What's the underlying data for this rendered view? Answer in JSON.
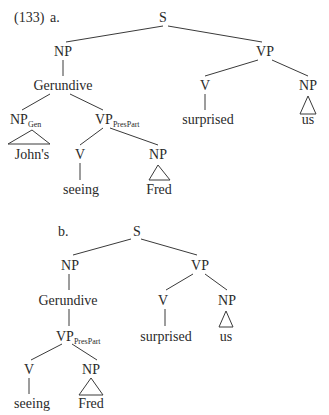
{
  "example_number": "(133)",
  "trees": [
    {
      "label": "a.",
      "label_pos": [
        50,
        22
      ],
      "nodes": [
        {
          "id": "S",
          "text": "S",
          "x": 163,
          "y": 22
        },
        {
          "id": "NP",
          "text": "NP",
          "x": 63,
          "y": 56
        },
        {
          "id": "VP",
          "text": "VP",
          "x": 265,
          "y": 56
        },
        {
          "id": "Ger",
          "text": "Gerundive",
          "x": 63,
          "y": 90
        },
        {
          "id": "V1",
          "text": "V",
          "x": 205,
          "y": 90
        },
        {
          "id": "NP2",
          "text": "NP",
          "x": 308,
          "y": 90
        },
        {
          "id": "NPGen",
          "text": "NP",
          "sub": "Gen",
          "x": 22,
          "y": 124
        },
        {
          "id": "VPPP",
          "text": "VP",
          "sub": "PresPart",
          "x": 107,
          "y": 124
        },
        {
          "id": "surprised",
          "text": "surprised",
          "x": 208,
          "y": 124
        },
        {
          "id": "us",
          "text": "us",
          "x": 308,
          "y": 124
        },
        {
          "id": "Johns",
          "text": "John's",
          "x": 32,
          "y": 159
        },
        {
          "id": "V2",
          "text": "V",
          "x": 80,
          "y": 159
        },
        {
          "id": "NP3",
          "text": "NP",
          "x": 158,
          "y": 159
        },
        {
          "id": "seeing",
          "text": "seeing",
          "x": 81,
          "y": 194
        },
        {
          "id": "Fred",
          "text": "Fred",
          "x": 159,
          "y": 194
        }
      ],
      "edges": [
        [
          163,
          26,
          66,
          42
        ],
        [
          168,
          26,
          262,
          42
        ],
        [
          63,
          60,
          63,
          76
        ],
        [
          50,
          94,
          22,
          110
        ],
        [
          70,
          94,
          103,
          110
        ],
        [
          258,
          60,
          205,
          76
        ],
        [
          272,
          60,
          308,
          76
        ],
        [
          205,
          94,
          205,
          110
        ],
        [
          103,
          128,
          80,
          145
        ],
        [
          110,
          128,
          158,
          145
        ],
        [
          80,
          163,
          80,
          180
        ]
      ],
      "triangles": [
        [
          [
            8,
            144
          ],
          [
            32,
            130
          ],
          [
            50,
            144
          ]
        ],
        [
          [
            300,
            114
          ],
          [
            308,
            96
          ],
          [
            316,
            114
          ]
        ],
        [
          [
            149,
            180
          ],
          [
            158,
            165
          ],
          [
            170,
            180
          ]
        ]
      ]
    },
    {
      "label": "b.",
      "label_pos": [
        58,
        236
      ],
      "nodes": [
        {
          "id": "S",
          "text": "S",
          "x": 137,
          "y": 236
        },
        {
          "id": "NP",
          "text": "NP",
          "x": 70,
          "y": 270
        },
        {
          "id": "VP",
          "text": "VP",
          "x": 200,
          "y": 270
        },
        {
          "id": "Ger",
          "text": "Gerundive",
          "x": 68,
          "y": 305
        },
        {
          "id": "V1",
          "text": "V",
          "x": 163,
          "y": 305
        },
        {
          "id": "NP2",
          "text": "NP",
          "x": 227,
          "y": 305
        },
        {
          "id": "VPPP",
          "text": "VP",
          "sub": "PresPart",
          "x": 68,
          "y": 341
        },
        {
          "id": "surprised",
          "text": "surprised",
          "x": 166,
          "y": 341
        },
        {
          "id": "us",
          "text": "us",
          "x": 226,
          "y": 341
        },
        {
          "id": "V2",
          "text": "V",
          "x": 29,
          "y": 374
        },
        {
          "id": "NP3",
          "text": "NP",
          "x": 91,
          "y": 374
        },
        {
          "id": "seeing",
          "text": "seeing",
          "x": 32,
          "y": 408
        },
        {
          "id": "Fred",
          "text": "Fred",
          "x": 91,
          "y": 408
        }
      ],
      "edges": [
        [
          131,
          239,
          73,
          255
        ],
        [
          141,
          239,
          197,
          255
        ],
        [
          69,
          274,
          69,
          290
        ],
        [
          193,
          274,
          166,
          290
        ],
        [
          205,
          274,
          227,
          290
        ],
        [
          69,
          309,
          69,
          326
        ],
        [
          165,
          309,
          165,
          326
        ],
        [
          62,
          344,
          31,
          360
        ],
        [
          72,
          344,
          97,
          360
        ],
        [
          29,
          378,
          29,
          394
        ]
      ],
      "triangles": [
        [
          [
            219,
            327
          ],
          [
            226,
            311
          ],
          [
            233,
            327
          ]
        ],
        [
          [
            79,
            395
          ],
          [
            91,
            378
          ],
          [
            103,
            395
          ]
        ]
      ]
    }
  ]
}
